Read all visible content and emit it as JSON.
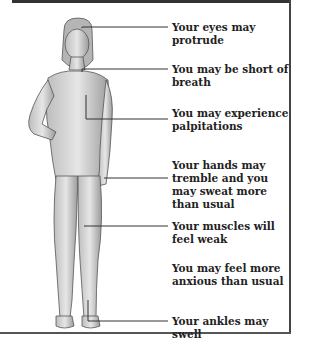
{
  "diagram": {
    "labels": [
      {
        "id": "eyes",
        "text": "Your eyes may protrude",
        "y": 21
      },
      {
        "id": "breath",
        "text": "You may be short of breath",
        "y": 63
      },
      {
        "id": "palpitations",
        "text": "You may experience palpitations",
        "y": 107
      },
      {
        "id": "hands",
        "text": "Your hands may tremble and you may sweat more than usual",
        "y": 159
      },
      {
        "id": "muscles",
        "text": "Your muscles will feel weak",
        "y": 220
      },
      {
        "id": "anxious",
        "text": "You may feel more anxious than usual",
        "y": 262
      },
      {
        "id": "ankles",
        "text": "Your ankles may swell",
        "y": 315
      }
    ]
  }
}
